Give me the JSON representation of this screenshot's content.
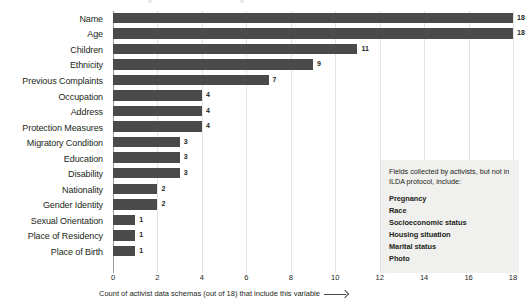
{
  "chart_data": {
    "type": "bar",
    "orientation": "horizontal",
    "title": "",
    "xlabel": "Count of activist data schemas (out of 18) that include this variable",
    "ylabel": "",
    "xlim": [
      0,
      18
    ],
    "xticks": [
      "0",
      "2",
      "4",
      "6",
      "8",
      "10",
      "12",
      "14",
      "16",
      "18"
    ],
    "grid": "vertical",
    "legend": "none",
    "bar_color": "#4a4a4a",
    "categories": [
      "Name",
      "Age",
      "Children",
      "Ethnicity",
      "Previous Complaints",
      "Occupation",
      "Address",
      "Protection Measures",
      "Migratory Condition",
      "Education",
      "Disability",
      "Nationality",
      "Gender Identity",
      "Sexual Orientation",
      "Place of Residency",
      "Place of Birth"
    ],
    "values": [
      18,
      18,
      11,
      9,
      7,
      4,
      4,
      4,
      3,
      3,
      3,
      2,
      2,
      1,
      1,
      1
    ],
    "value_labels": [
      "18",
      "18",
      "11",
      "9",
      "7",
      "4",
      "4",
      "4",
      "3",
      "3",
      "3",
      "2",
      "2",
      "1",
      "1",
      "1"
    ],
    "annotation": {
      "intro": "Fields collected by activists, but not in ILDA protocol, include:",
      "fields": [
        "Pregnancy",
        "Race",
        "Socioeconomic status",
        "Housing situation",
        "Marital status",
        "Photo"
      ],
      "background_color": "#f0f0ee"
    }
  }
}
